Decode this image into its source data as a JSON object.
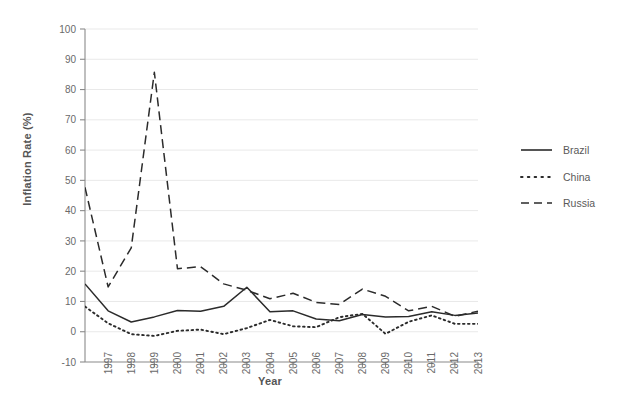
{
  "chart_data": {
    "type": "line",
    "title": "",
    "xlabel": "Year",
    "ylabel": "Inflation Rate (%)",
    "xlim": [
      1996,
      2013
    ],
    "ylim": [
      -10,
      100
    ],
    "ytick_step": 10,
    "grid": true,
    "grid_axis": "y",
    "legend_position": "right",
    "x": [
      1996,
      1997,
      1998,
      1999,
      2000,
      2001,
      2002,
      2003,
      2004,
      2005,
      2006,
      2007,
      2008,
      2009,
      2010,
      2011,
      2012,
      2013
    ],
    "xticks": [
      "1997",
      "1998",
      "1999",
      "2000",
      "2001",
      "2002",
      "2003",
      "2004",
      "2005",
      "2006",
      "2007",
      "2008",
      "2009",
      "2010",
      "2011",
      "2012",
      "2013"
    ],
    "yticks": [
      "-10",
      "0",
      "10",
      "20",
      "30",
      "40",
      "50",
      "60",
      "70",
      "80",
      "90",
      "100"
    ],
    "series": [
      {
        "name": "Brazil",
        "style": "solid",
        "color": "#2b2b2b",
        "values": [
          15.8,
          6.9,
          3.2,
          4.9,
          7.0,
          6.8,
          8.4,
          14.7,
          6.6,
          6.9,
          4.2,
          3.6,
          5.7,
          4.9,
          5.0,
          6.6,
          5.4,
          6.2
        ]
      },
      {
        "name": "China",
        "style": "dotted",
        "color": "#2b2b2b",
        "values": [
          8.3,
          2.8,
          -0.8,
          -1.4,
          0.3,
          0.7,
          -0.8,
          1.2,
          3.9,
          1.8,
          1.5,
          4.8,
          5.9,
          -0.7,
          3.3,
          5.4,
          2.6,
          2.6
        ]
      },
      {
        "name": "Russia",
        "style": "dashed",
        "color": "#2b2b2b",
        "values": [
          47.7,
          14.8,
          27.7,
          85.7,
          20.8,
          21.5,
          15.8,
          13.7,
          10.9,
          12.7,
          9.7,
          9.0,
          14.1,
          11.7,
          6.9,
          8.4,
          5.1,
          6.8
        ]
      }
    ]
  },
  "legend": {
    "items": [
      {
        "label": "Brazil",
        "style": "solid"
      },
      {
        "label": "China",
        "style": "dotted"
      },
      {
        "label": "Russia",
        "style": "dashed"
      }
    ]
  },
  "caption": ""
}
